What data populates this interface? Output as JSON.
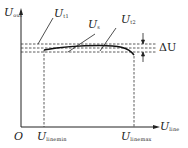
{
  "diagram": {
    "colors": {
      "line": "#222222",
      "background": "#ffffff"
    },
    "y_axis": {
      "symbol": "U",
      "subscript": "out"
    },
    "x_axis": {
      "symbol": "U",
      "subscript": "line"
    },
    "origin": "O",
    "x_ticks": [
      {
        "symbol": "U",
        "subscript": "linemin"
      },
      {
        "symbol": "U",
        "subscript": "linemax"
      }
    ],
    "curve_labels": [
      {
        "symbol": "U",
        "subscript": "t1"
      },
      {
        "symbol": "U",
        "subscript": "s"
      },
      {
        "symbol": "U",
        "subscript": "t2"
      }
    ],
    "delta_label": "ΔU"
  }
}
